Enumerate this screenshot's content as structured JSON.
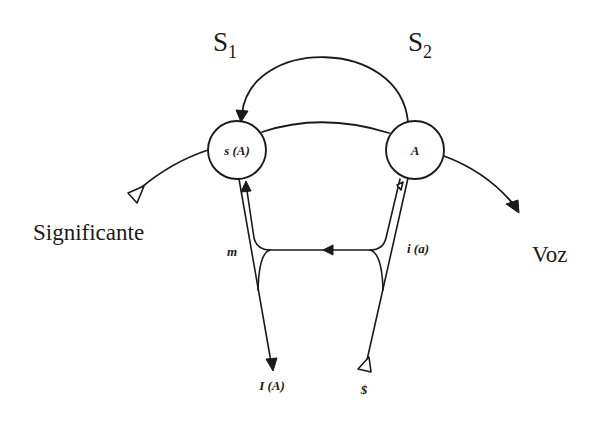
{
  "diagram": {
    "top_labels": {
      "s1": {
        "letter": "S",
        "sub": "1"
      },
      "s2": {
        "letter": "S",
        "sub": "2"
      }
    },
    "nodes": {
      "s_of_A": {
        "label": "s (A)"
      },
      "A": {
        "label": "A"
      }
    },
    "edge_labels": {
      "m": "m",
      "i_a": "i (a)",
      "I_A": "I (A)",
      "barred_s": "$"
    },
    "side_labels": {
      "left": "Significante",
      "right": "Voz"
    },
    "colors": {
      "line": "#1a1a1a",
      "background": "#ffffff"
    }
  }
}
